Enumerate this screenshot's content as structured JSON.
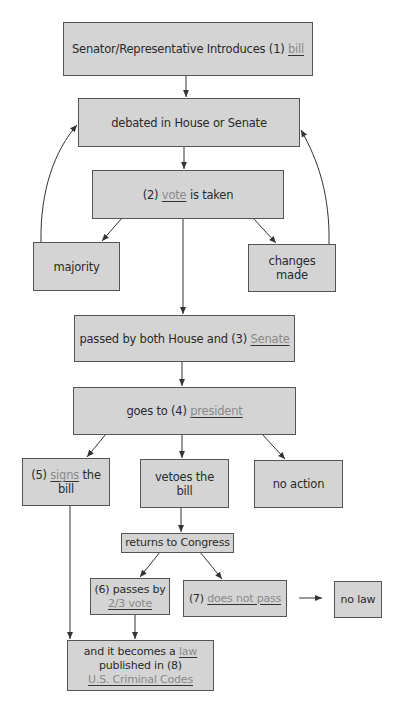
{
  "diagram": {
    "type": "flowchart",
    "colors": {
      "box_fill": "#d4d4d4",
      "box_border": "#555555",
      "text": "#2a2a2a",
      "blank_term": "#8a8a8a",
      "line": "#333333"
    },
    "nodes": {
      "introduce": {
        "prefix": "Senator/Representative Introduces (1) ",
        "term": "bill",
        "suffix": ""
      },
      "debated": {
        "text": "debated in House or Senate"
      },
      "vote": {
        "prefix": "(2) ",
        "term": "vote",
        "suffix": " is taken"
      },
      "majority": {
        "text": "majority"
      },
      "changes": {
        "text": "changes made"
      },
      "passed": {
        "prefix": "passed by both House and (3) ",
        "term": "Senate",
        "suffix": ""
      },
      "president": {
        "prefix": "goes to (4) ",
        "term": "president",
        "suffix": ""
      },
      "signs": {
        "prefix": "(5) ",
        "term": "signs",
        "suffix": " the",
        "line2": "bill"
      },
      "vetoes": {
        "line1": "vetoes the",
        "line2": "bill"
      },
      "no_action": {
        "text": "no action"
      },
      "returns": {
        "text": "returns to Congress"
      },
      "passes_two_thirds": {
        "line1": "(6) passes by",
        "term": "2/3 vote"
      },
      "does_not_pass": {
        "prefix": "(7) ",
        "term": "does not pass"
      },
      "no_law": {
        "text": "no law"
      },
      "becomes_law": {
        "prefix": "and it becomes a ",
        "term": "law",
        "line2": "published in (8)",
        "term2": "U.S. Criminal Codes"
      }
    },
    "edges": [
      {
        "from": "introduce",
        "to": "debated"
      },
      {
        "from": "debated",
        "to": "vote"
      },
      {
        "from": "vote",
        "to": "majority"
      },
      {
        "from": "vote",
        "to": "changes"
      },
      {
        "from": "vote",
        "to": "passed"
      },
      {
        "from": "majority",
        "to": "debated",
        "style": "curved"
      },
      {
        "from": "changes",
        "to": "debated",
        "style": "curved"
      },
      {
        "from": "passed",
        "to": "president"
      },
      {
        "from": "president",
        "to": "signs"
      },
      {
        "from": "president",
        "to": "vetoes"
      },
      {
        "from": "president",
        "to": "no_action"
      },
      {
        "from": "vetoes",
        "to": "returns"
      },
      {
        "from": "returns",
        "to": "passes_two_thirds"
      },
      {
        "from": "returns",
        "to": "does_not_pass"
      },
      {
        "from": "does_not_pass",
        "to": "no_law"
      },
      {
        "from": "signs",
        "to": "becomes_law"
      },
      {
        "from": "passes_two_thirds",
        "to": "becomes_law"
      }
    ]
  }
}
